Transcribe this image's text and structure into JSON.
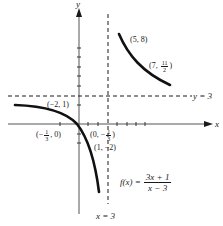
{
  "diagram": {
    "axes": {
      "x_label": "x",
      "y_label": "y"
    },
    "asymptotes": {
      "horizontal": "y = 3",
      "vertical": "x = 3"
    },
    "function": {
      "lhs": "f(x) =",
      "numerator": "3x + 1",
      "denominator": "x − 3"
    },
    "points": [
      {
        "label": "(5, 8)"
      },
      {
        "label_prefix": "(7, ",
        "frac_num": "11",
        "frac_den": "2",
        "label_suffix": ")"
      },
      {
        "label": "(−2, 1)"
      },
      {
        "label_prefix": "(−",
        "frac_num": "1",
        "frac_den": "3",
        "label_suffix": ", 0)"
      },
      {
        "label_prefix": "(0, −",
        "frac_num": "1",
        "frac_den": "3",
        "label_suffix": ")"
      },
      {
        "label": "(1, −2)"
      }
    ],
    "colors": {
      "ink": "#1a1a1a",
      "axis": "#555555",
      "background": "#ffffff"
    }
  }
}
